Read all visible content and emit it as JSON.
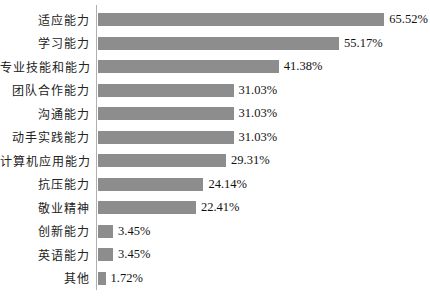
{
  "chart_data": {
    "type": "bar",
    "orientation": "horizontal",
    "title": "",
    "xlabel": "",
    "ylabel": "",
    "xlim": [
      0,
      70
    ],
    "grid": false,
    "legend": false,
    "bar_color": "#8d8d8d",
    "axis_color": "#b0b0b0",
    "text_color": "#111111",
    "categories": [
      "适应能力",
      "学习能力",
      "专业技能和能力",
      "团队合作能力",
      "沟通能力",
      "动手实践能力",
      "计算机应用能力",
      "抗压能力",
      "敬业精神",
      "创新能力",
      "英语能力",
      "其他"
    ],
    "values": [
      65.52,
      55.17,
      41.38,
      31.03,
      31.03,
      31.03,
      29.31,
      24.14,
      22.41,
      3.45,
      3.45,
      1.72
    ],
    "value_labels": [
      "65.52%",
      "55.17%",
      "41.38%",
      "31.03%",
      "31.03%",
      "31.03%",
      "29.31%",
      "24.14%",
      "22.41%",
      "3.45%",
      "3.45%",
      "1.72%"
    ]
  }
}
